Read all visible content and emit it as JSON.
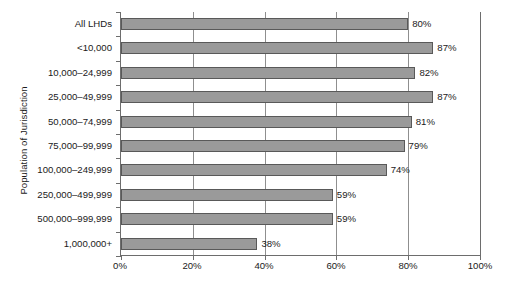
{
  "chart_data": {
    "type": "bar",
    "orientation": "horizontal",
    "title": "",
    "xlabel": "",
    "ylabel": "Population of Jurisdiction",
    "xlim": [
      0,
      100
    ],
    "xticks": [
      "0%",
      "20%",
      "40%",
      "60%",
      "80%",
      "100%"
    ],
    "xtick_values": [
      0,
      20,
      40,
      60,
      80,
      100
    ],
    "grid": true,
    "grid_axis": "x",
    "legend": false,
    "categories": [
      "All LHDs",
      "<10,000",
      "10,000–24,999",
      "25,000–49,999",
      "50,000–74,999",
      "75,000–99,999",
      "100,000–249,999",
      "250,000–499,999",
      "500,000–999,999",
      "1,000,000+"
    ],
    "values": [
      80,
      87,
      82,
      87,
      81,
      79,
      74,
      59,
      59,
      38
    ],
    "value_labels": [
      "80%",
      "87%",
      "82%",
      "87%",
      "81%",
      "79%",
      "74%",
      "59%",
      "59%",
      "38%"
    ],
    "colors": {
      "bar_fill": "#9a9a9a",
      "bar_border": "#595959",
      "axis": "#6d6d6d",
      "gridline": "#8f8f8f",
      "text": "#1a1a1a",
      "background": "#ffffff"
    }
  }
}
